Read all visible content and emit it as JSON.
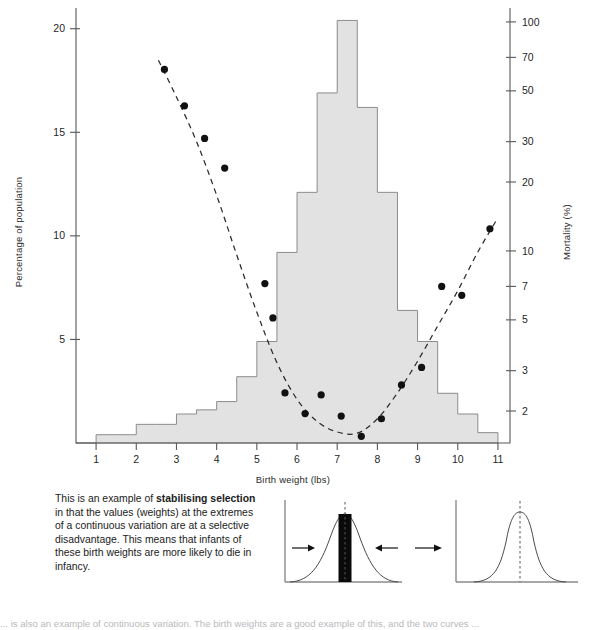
{
  "figure": {
    "left_axis_title": "Percentage of population",
    "right_axis_title": "Mortality (%)",
    "x_axis_title": "Birth weight (lbs)"
  },
  "caption": {
    "line1_pre": "This is an example of ",
    "line1_bold": "stabilising selection",
    "body": " in that the values (weights) at the extremes of a continuous variation are at a selective disadvantage. This means that infants of these birth weights are more likely to die in infancy."
  },
  "footnote": {
    "text": "... is also an example of continuous variation. The birth weights are a good example of this, and the two curves ..."
  },
  "diagram": {
    "left_panel_name": "stabilising-selection-before",
    "right_panel_name": "stabilising-selection-after",
    "transition_arrow": "→"
  },
  "chart_data": {
    "type": "bar",
    "title": "",
    "xlabel": "Birth weight (lbs)",
    "ylabel": "Percentage of population",
    "y2label": "Mortality (%)",
    "grid": false,
    "legend": "none",
    "xlim": [
      0.5,
      11.3
    ],
    "ylim": [
      0,
      21.0
    ],
    "y_ticks": [
      5,
      10,
      15,
      20
    ],
    "x_ticks": [
      1,
      2,
      3,
      4,
      5,
      6,
      7,
      8,
      9,
      10,
      11
    ],
    "y2_scale": "log",
    "y2_ticks": [
      2,
      3,
      5,
      7,
      10,
      20,
      30,
      50,
      70,
      100
    ],
    "y2lim": [
      1.45,
      115
    ],
    "histogram": {
      "name": "birth-weight-distribution",
      "bin_width": 0.5,
      "bin_starts": [
        0.5,
        1.0,
        1.5,
        2.0,
        2.5,
        3.0,
        3.5,
        4.0,
        4.5,
        5.0,
        5.5,
        6.0,
        6.5,
        7.0,
        7.5,
        8.0,
        8.5,
        9.0,
        9.5,
        10.0,
        10.5
      ],
      "percentages": [
        0.0,
        0.4,
        0.4,
        0.9,
        0.9,
        1.4,
        1.6,
        2.0,
        3.2,
        4.9,
        9.2,
        12.1,
        16.9,
        20.4,
        16.2,
        12.1,
        6.4,
        4.9,
        2.4,
        1.4,
        0.5
      ]
    },
    "mortality_points": {
      "name": "mortality-data-points",
      "x": [
        2.7,
        3.2,
        3.7,
        4.2,
        5.2,
        5.4,
        5.7,
        6.2,
        6.6,
        7.1,
        7.6,
        8.1,
        8.6,
        9.1,
        9.6,
        10.1,
        10.8
      ],
      "y": [
        62.0,
        43.0,
        31.0,
        23.0,
        7.2,
        5.1,
        2.4,
        1.95,
        2.35,
        1.9,
        1.55,
        1.85,
        2.6,
        3.1,
        7.0,
        6.4,
        12.5
      ]
    },
    "fit_curve": {
      "name": "mortality-fitted-curve",
      "style": "dashed",
      "x": [
        2.55,
        3.0,
        3.5,
        4.0,
        4.5,
        5.0,
        5.5,
        6.0,
        6.5,
        7.0,
        7.5,
        8.0,
        8.5,
        9.0,
        9.5,
        10.0,
        10.5,
        10.95
      ],
      "y": [
        68.0,
        47.0,
        30.0,
        17.5,
        9.6,
        5.4,
        3.25,
        2.25,
        1.8,
        1.62,
        1.6,
        1.85,
        2.4,
        3.3,
        4.7,
        6.7,
        9.9,
        13.5
      ]
    }
  }
}
